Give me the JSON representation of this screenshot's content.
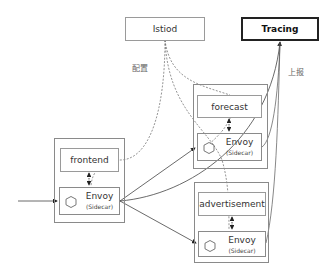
{
  "diagram": {
    "nodes": {
      "istiod": {
        "label": "Istiod"
      },
      "tracing": {
        "label": "Tracing"
      },
      "frontend": {
        "app_label": "frontend",
        "proxy_label": "Envoy",
        "proxy_sub": "(Sidecar)"
      },
      "forecast": {
        "app_label": "forecast",
        "proxy_label": "Envoy",
        "proxy_sub": "(Sidecar)"
      },
      "advertisement": {
        "app_label": "advertisement",
        "proxy_label": "Envoy",
        "proxy_sub": "(Sidecar)"
      }
    },
    "edge_labels": {
      "config": "配置",
      "report": "上报"
    },
    "edges": [
      {
        "from": "external",
        "to": "frontend.envoy",
        "style": "solid"
      },
      {
        "from": "frontend.envoy",
        "to": "forecast.envoy",
        "style": "solid"
      },
      {
        "from": "frontend.envoy",
        "to": "advertisement.envoy",
        "style": "solid"
      },
      {
        "from": "frontend.envoy",
        "to": "tracing",
        "style": "solid"
      },
      {
        "from": "forecast.envoy",
        "to": "tracing",
        "style": "solid"
      },
      {
        "from": "advertisement.envoy",
        "to": "tracing",
        "style": "solid"
      },
      {
        "from": "istiod",
        "to": "frontend.envoy",
        "style": "dashed"
      },
      {
        "from": "istiod",
        "to": "forecast.envoy",
        "style": "dashed"
      },
      {
        "from": "istiod",
        "to": "advertisement.envoy",
        "style": "dashed"
      },
      {
        "from": "frontend",
        "to": "frontend.envoy",
        "style": "dashed-bidirectional"
      },
      {
        "from": "forecast",
        "to": "forecast.envoy",
        "style": "dashed-bidirectional"
      },
      {
        "from": "advertisement",
        "to": "advertisement.envoy",
        "style": "dashed-bidirectional"
      }
    ],
    "colors": {
      "line": "#333333",
      "border": "#8a8a8a",
      "tracing_border": "#222222"
    }
  }
}
